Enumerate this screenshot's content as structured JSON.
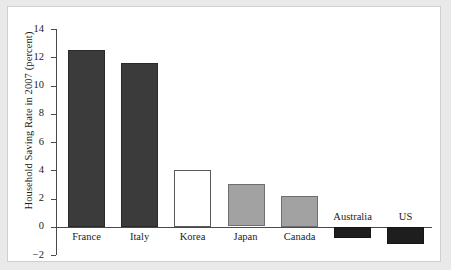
{
  "chart_data": {
    "type": "bar",
    "title": "",
    "xlabel": "",
    "ylabel": "Household Saving Rate in 2007 (percent)",
    "categories": [
      "France",
      "Italy",
      "Korea",
      "Japan",
      "Canada",
      "Australia",
      "US"
    ],
    "values": [
      12.5,
      11.6,
      4.0,
      3.0,
      2.2,
      -0.8,
      -1.2
    ],
    "ylim": [
      -2,
      14
    ],
    "yticks": [
      14,
      12,
      10,
      8,
      6,
      4,
      2,
      0,
      -2
    ],
    "ytick_labels": [
      "14",
      "12",
      "10",
      "8",
      "6",
      "4",
      "2",
      "0",
      "−2"
    ],
    "grid": false,
    "legend": "none",
    "bar_styles": [
      "dark",
      "dark",
      "white",
      "mid",
      "mid",
      "black",
      "black"
    ],
    "colors": {
      "dark_fill": "#3b3b3b",
      "mid_fill": "#a2a2a2",
      "white_fill": "#ffffff",
      "black_fill": "#1e1e1e",
      "axis": "#4a4a4a",
      "text": "#1b1b1b",
      "plot_background": "#ffffff",
      "figure_background": "#e9e9e9"
    }
  }
}
